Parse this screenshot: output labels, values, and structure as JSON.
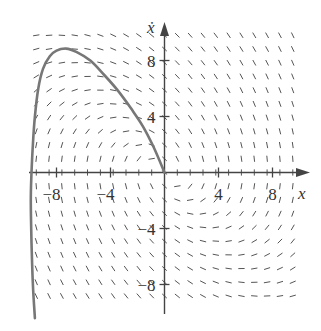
{
  "chart_data": {
    "type": "line",
    "subtype": "phase-portrait-direction-field",
    "title": "",
    "xlabel": "x",
    "ylabel": "ẋ",
    "xlim": [
      -10,
      10
    ],
    "ylim": [
      -10.5,
      10.5
    ],
    "x_ticks": [
      {
        "value": -8,
        "label": "−8"
      },
      {
        "value": -4,
        "label": "−4"
      },
      {
        "value": 4,
        "label": "4"
      },
      {
        "value": 8,
        "label": "8"
      }
    ],
    "y_ticks": [
      {
        "value": 8,
        "label": "8"
      },
      {
        "value": 4,
        "label": "4"
      },
      {
        "value": -4,
        "label": "−4"
      },
      {
        "value": -8,
        "label": "−8"
      }
    ],
    "grid": false,
    "legend": null,
    "direction_field": {
      "x_range": [
        -9.5,
        9.5
      ],
      "y_range": [
        -9.5,
        9.8
      ],
      "x_step": 0.95,
      "y_step": 0.98,
      "description": "Short slope segments; nearly vertical away from curve ẋ̇=0, swirling near (−6,5) and (6,−7)"
    },
    "series": [
      {
        "name": "trajectory",
        "color": "#777777",
        "points": [
          [
            -9.6,
            -10.4
          ],
          [
            -9.75,
            -8
          ],
          [
            -9.85,
            -5
          ],
          [
            -9.9,
            -2
          ],
          [
            -9.85,
            0
          ],
          [
            -9.75,
            2
          ],
          [
            -9.6,
            4
          ],
          [
            -9.35,
            6
          ],
          [
            -9.0,
            7.4
          ],
          [
            -8.5,
            8.3
          ],
          [
            -8.0,
            8.7
          ],
          [
            -7.3,
            8.85
          ],
          [
            -6.5,
            8.6
          ],
          [
            -5.5,
            8.0
          ],
          [
            -4.5,
            7.0
          ],
          [
            -3.5,
            5.9
          ],
          [
            -2.5,
            4.6
          ],
          [
            -1.6,
            3.3
          ],
          [
            -0.8,
            1.8
          ],
          [
            0,
            0
          ]
        ]
      }
    ]
  },
  "axes": {
    "x_label": "x",
    "y_label": "ẋ"
  }
}
